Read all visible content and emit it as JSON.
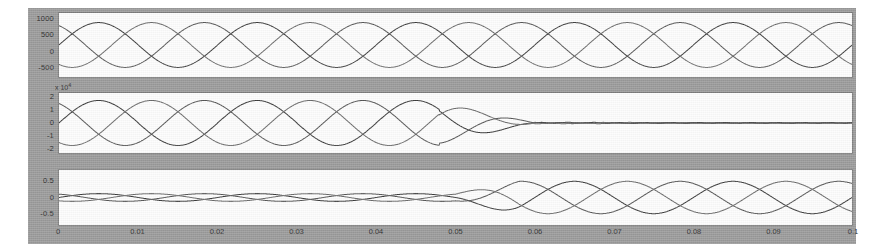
{
  "figure": {
    "background_color": "#9a9a9a",
    "axes_background_color": "#fdfdfd",
    "curve_color": "#3a3a3a"
  },
  "subplot1": {
    "name": "stator-currents-plot",
    "yticks": [
      "1000",
      "500",
      "0",
      "-500"
    ],
    "ytick_values": [
      1000,
      500,
      0,
      -500
    ],
    "ylim": [
      -800,
      1200
    ]
  },
  "subplot2": {
    "name": "rotor-currents-plot",
    "exponent_label": "x 10",
    "exponent_power": "4",
    "yticks": [
      "2",
      "1",
      "0",
      "-1",
      "-2"
    ],
    "ytick_values": [
      2,
      1,
      0,
      -1,
      -2
    ],
    "ylim": [
      -2.4,
      2.4
    ]
  },
  "subplot3": {
    "name": "torque-plot",
    "yticks": [
      "0.5",
      "0",
      "-0.5"
    ],
    "ytick_values": [
      0.5,
      0,
      -0.5
    ],
    "ylim": [
      -0.85,
      0.85
    ]
  },
  "xaxis": {
    "ticks": [
      "0",
      "0.01",
      "0.02",
      "0.03",
      "0.04",
      "0.05",
      "0.06",
      "0.07",
      "0.08",
      "0.09",
      "0.1"
    ],
    "tick_values": [
      0,
      0.01,
      0.02,
      0.03,
      0.04,
      0.05,
      0.06,
      0.07,
      0.08,
      0.09,
      0.1
    ],
    "xlim": [
      0,
      0.1
    ]
  },
  "chart_data": {
    "type": "line",
    "title": "",
    "subtitle": "",
    "xlabel": "",
    "ylabel": "",
    "grid": false,
    "legend_position": "none",
    "layout": "3 stacked subplots sharing a common x axis (time, 0 to 0.1 s)",
    "panels": [
      {
        "index": 1,
        "name": "subplot1",
        "ylabel": "",
        "ylim": [
          -800,
          1200
        ],
        "yticks": [
          1000,
          500,
          0,
          -500
        ],
        "xlim": [
          0,
          0.1
        ],
        "description": "Three-phase sinusoidal waveforms, constant amplitude across the full time span, 120 degrees apart.",
        "series": [
          {
            "name": "phase-a",
            "waveform": "sine",
            "amplitude": 700,
            "frequency_hz": 50,
            "phase_deg": 0,
            "offset": 200,
            "decay": "none"
          },
          {
            "name": "phase-b",
            "waveform": "sine",
            "amplitude": 700,
            "frequency_hz": 50,
            "phase_deg": 120,
            "offset": 200,
            "decay": "none"
          },
          {
            "name": "phase-c",
            "waveform": "sine",
            "amplitude": 700,
            "frequency_hz": 50,
            "phase_deg": 240,
            "offset": 200,
            "decay": "none"
          }
        ]
      },
      {
        "index": 2,
        "name": "subplot2",
        "ylabel": "",
        "ylim": [
          -2.4,
          2.4
        ],
        "yticks": [
          2,
          1,
          0,
          -1,
          -2
        ],
        "scale_exponent": 4,
        "xlim": [
          0,
          0.1
        ],
        "description": "Three-phase sinusoidal waveforms of amplitude ~1.8e4 that collapse abruptly to near zero at about t = 0.06 s and stay flat afterwards.",
        "collapse_time": 0.06,
        "series": [
          {
            "name": "phase-a",
            "waveform": "sine",
            "amplitude": 1.8,
            "frequency_hz": 50,
            "phase_deg": 0,
            "decay": "collapse-to-zero-at-0.06"
          },
          {
            "name": "phase-b",
            "waveform": "sine",
            "amplitude": 1.8,
            "frequency_hz": 50,
            "phase_deg": 120,
            "decay": "collapse-to-zero-at-0.06"
          },
          {
            "name": "phase-c",
            "waveform": "sine",
            "amplitude": 1.8,
            "frequency_hz": 50,
            "phase_deg": 240,
            "decay": "collapse-to-zero-at-0.06"
          }
        ]
      },
      {
        "index": 3,
        "name": "subplot3",
        "ylabel": "",
        "ylim": [
          -0.85,
          0.85
        ],
        "yticks": [
          0.5,
          0,
          -0.5
        ],
        "xlim": [
          0,
          0.1
        ],
        "description": "Low amplitude three-phase waveforms (about 0.12) for t below 0.05 s that grow to amplitude about 0.5 after t = 0.05 s.",
        "growth_time": 0.05,
        "series": [
          {
            "name": "phase-a",
            "waveform": "sine",
            "amplitude_before": 0.12,
            "amplitude_after": 0.5,
            "frequency_hz": 50,
            "phase_deg": 0
          },
          {
            "name": "phase-b",
            "waveform": "sine",
            "amplitude_before": 0.12,
            "amplitude_after": 0.5,
            "frequency_hz": 50,
            "phase_deg": 120
          },
          {
            "name": "phase-c",
            "waveform": "sine",
            "amplitude_before": 0.12,
            "amplitude_after": 0.5,
            "frequency_hz": 50,
            "phase_deg": 240
          }
        ]
      }
    ]
  }
}
